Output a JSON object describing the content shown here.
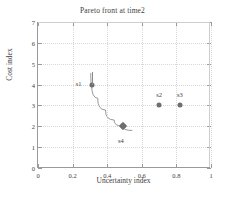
{
  "chart_data": {
    "type": "scatter",
    "title": "Pareto front at time2",
    "xlabel": "Uncertainty index",
    "ylabel": "Cost index",
    "xlim": [
      0,
      1
    ],
    "ylim": [
      0,
      7
    ],
    "xticks": [
      "0",
      "0.2",
      "0.4",
      "0.6",
      "0.8",
      "1"
    ],
    "xtick_values": [
      0,
      0.2,
      0.4,
      0.6,
      0.8,
      1
    ],
    "yticks": [
      "0",
      "1",
      "2",
      "3",
      "4",
      "5",
      "6",
      "7"
    ],
    "ytick_values": [
      0,
      1,
      2,
      3,
      4,
      5,
      6,
      7
    ],
    "grid": true,
    "legend": "none",
    "points": [
      {
        "name": "s1",
        "x": 0.31,
        "y": 4,
        "marker": "circle",
        "label_dx": -13,
        "label_dy": -2
      },
      {
        "name": "s4",
        "x": 0.49,
        "y": 2,
        "marker": "diamond",
        "label_dx": -2,
        "label_dy": 14
      },
      {
        "name": "s2",
        "x": 0.7,
        "y": 3,
        "marker": "circle",
        "label_dx": 0,
        "label_dy": -11
      },
      {
        "name": "s3",
        "x": 0.82,
        "y": 3,
        "marker": "circle",
        "label_dx": 0,
        "label_dy": -11
      }
    ],
    "pareto_curve": {
      "description": "gray curve through s1 and s4",
      "points": [
        [
          0.305,
          4.55
        ],
        [
          0.31,
          4.0
        ],
        [
          0.345,
          3.35
        ],
        [
          0.39,
          2.78
        ],
        [
          0.44,
          2.3
        ],
        [
          0.49,
          2.0
        ],
        [
          0.545,
          1.8
        ]
      ]
    },
    "colors": {
      "marker": "#6e6e6e",
      "curve": "#8c8c8c",
      "grid": "#d8d8d8",
      "axis": "#9a9a9a",
      "text": "#3d3d3d",
      "background": "#ffffff"
    }
  }
}
